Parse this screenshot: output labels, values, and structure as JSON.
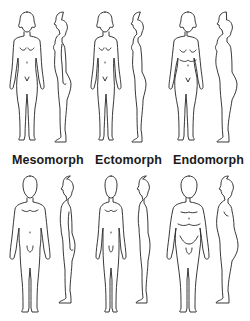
{
  "labels": {
    "mesomorph": "Mesomorph",
    "ectomorph": "Ectomorph",
    "endomorph": "Endomorph"
  },
  "figures": {
    "female": [
      {
        "type": "mesomorph",
        "views": [
          "front",
          "side"
        ]
      },
      {
        "type": "ectomorph",
        "views": [
          "front",
          "side"
        ]
      },
      {
        "type": "endomorph",
        "views": [
          "front",
          "side"
        ]
      }
    ],
    "male": [
      {
        "type": "mesomorph",
        "views": [
          "front",
          "side"
        ]
      },
      {
        "type": "ectomorph",
        "views": [
          "front",
          "side"
        ]
      },
      {
        "type": "endomorph",
        "views": [
          "front",
          "side"
        ]
      }
    ]
  },
  "colors": {
    "line": "#222222",
    "background": "#ffffff",
    "label": "#1a1a1a"
  }
}
